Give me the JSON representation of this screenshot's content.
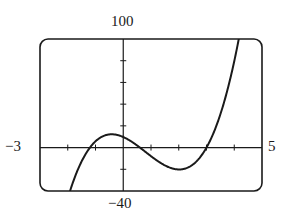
{
  "chart_data": {
    "type": "line",
    "title": "",
    "xlabel": "",
    "ylabel": "",
    "xlim": [
      -3,
      5
    ],
    "ylim": [
      -40,
      100
    ],
    "window_labels": {
      "xmin": "−3",
      "xmax": "5",
      "ymin": "−40",
      "ymax": "100"
    },
    "x_ticks": [
      -2,
      -1,
      1,
      2,
      3,
      4
    ],
    "y_ticks": [
      -20,
      20,
      40,
      60,
      80
    ],
    "grid": false,
    "function": "y = 4.5 (x + 1.2)(x - 0.6)(x - 3)",
    "series": [
      {
        "name": "f(x)",
        "x": [
          -2.0,
          -1.5,
          -1.2,
          -1.0,
          -0.5,
          0.0,
          0.6,
          1.0,
          1.5,
          2.0,
          2.5,
          3.0,
          3.5,
          4.0,
          4.2
        ],
        "y": [
          -46.8,
          -13.6,
          0,
          8.6,
          12.0,
          9.7,
          0,
          -9.9,
          -17.7,
          -20.2,
          -14.6,
          0,
          26.8,
          69.5,
          104.9
        ]
      }
    ],
    "features": {
      "local_max": [
        -0.5,
        12
      ],
      "local_min": [
        2.0,
        -20
      ],
      "x_intercepts": [
        -1.2,
        0.6,
        3.0
      ],
      "y_intercept": 9.7
    }
  }
}
